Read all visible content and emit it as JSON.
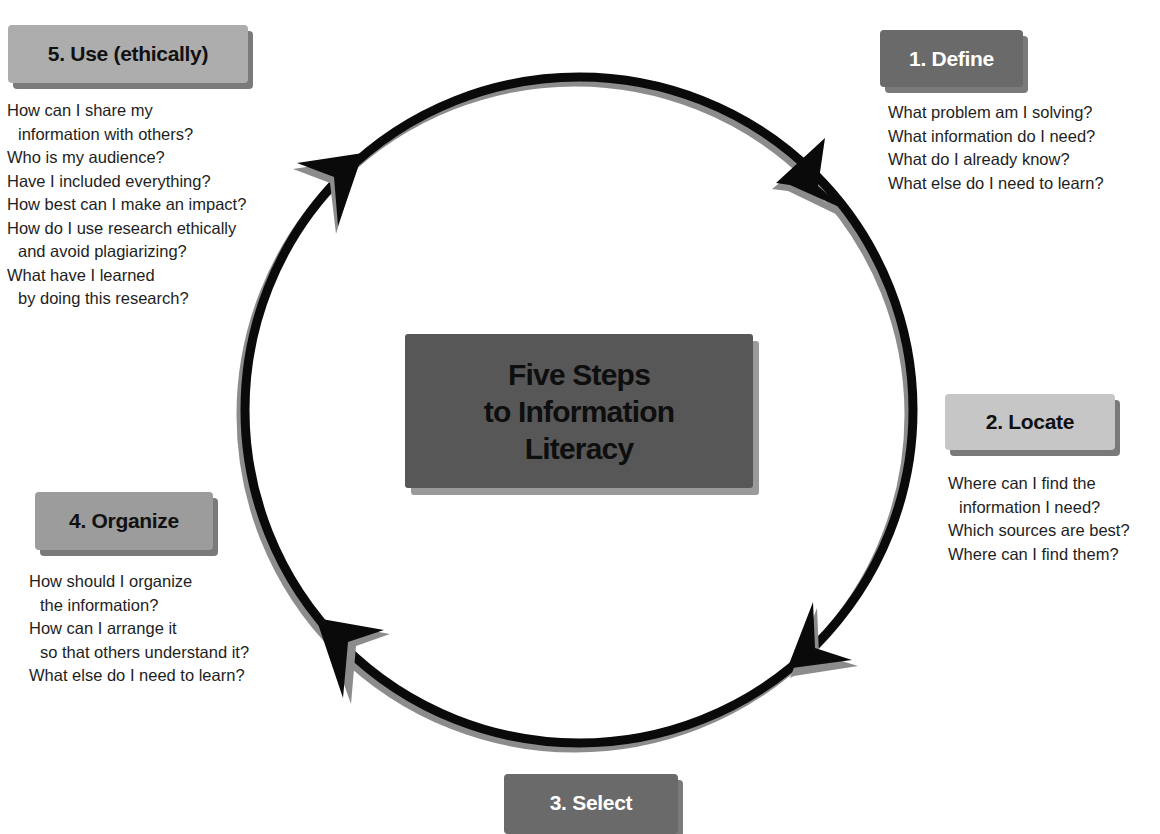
{
  "title": {
    "lines": [
      "Five Steps",
      "to Information",
      "Literacy"
    ]
  },
  "steps": [
    {
      "label": "1. Define",
      "questions": [
        {
          "text": "What problem am I solving?",
          "indent": false
        },
        {
          "text": "What information do I need?",
          "indent": false
        },
        {
          "text": "What do I already know?",
          "indent": false
        },
        {
          "text": "What else do I need to learn?",
          "indent": false
        }
      ]
    },
    {
      "label": "2. Locate",
      "questions": [
        {
          "text": "Where can I find the",
          "indent": false
        },
        {
          "text": "information I need?",
          "indent": true
        },
        {
          "text": "Which sources are best?",
          "indent": false
        },
        {
          "text": "Where can I find them?",
          "indent": false
        }
      ]
    },
    {
      "label": "3. Select",
      "questions": []
    },
    {
      "label": "4. Organize",
      "questions": [
        {
          "text": "How should I organize",
          "indent": false
        },
        {
          "text": "the information?",
          "indent": true
        },
        {
          "text": "How can I arrange it",
          "indent": false
        },
        {
          "text": "so that others understand it?",
          "indent": true
        },
        {
          "text": "What else do I need to learn?",
          "indent": false
        }
      ]
    },
    {
      "label": "5. Use (ethically)",
      "questions": [
        {
          "text": "How can I share my",
          "indent": false
        },
        {
          "text": "information with others?",
          "indent": true
        },
        {
          "text": "Who is my audience?",
          "indent": false
        },
        {
          "text": "Have I included everything?",
          "indent": false
        },
        {
          "text": "How best can I make an impact?",
          "indent": false
        },
        {
          "text": "How do I use research ethically",
          "indent": false
        },
        {
          "text": "and avoid plagiarizing?",
          "indent": true
        },
        {
          "text": "What have I learned",
          "indent": false
        },
        {
          "text": "by doing this research?",
          "indent": true
        }
      ]
    }
  ],
  "colors": {
    "cycle_stroke": "#0a0a0a",
    "cycle_shadow": "#8c8c8c",
    "center_box": "#575757",
    "dark_box": "#6a6a6a",
    "light_box": "#adadad"
  }
}
